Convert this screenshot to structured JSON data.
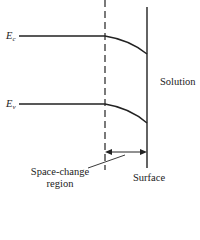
{
  "diagram": {
    "type": "semiconductor band bending at surface",
    "labels": {
      "ec_main": "E",
      "ec_sub": "c",
      "ev_main": "E",
      "ev_sub": "v",
      "solution": "Solution",
      "surface": "Surface",
      "space_region_line1": "Space-change",
      "space_region_line2": "region"
    },
    "colors": {
      "line": "#222222",
      "background": "#ffffff"
    }
  }
}
